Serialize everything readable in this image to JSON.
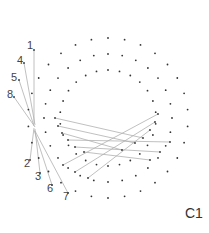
{
  "diagram": {
    "corner_label": "C1",
    "rings": [
      {
        "name": "outer",
        "dot_count": 30
      },
      {
        "name": "middle",
        "dot_count": 28
      },
      {
        "name": "inner",
        "dot_count": 26
      }
    ],
    "labels": [
      "1",
      "4",
      "5",
      "8",
      "2",
      "3",
      "6",
      "7"
    ],
    "colors": {
      "dot": "#333333",
      "line": "#b0b0b0",
      "text": "#444444"
    }
  }
}
